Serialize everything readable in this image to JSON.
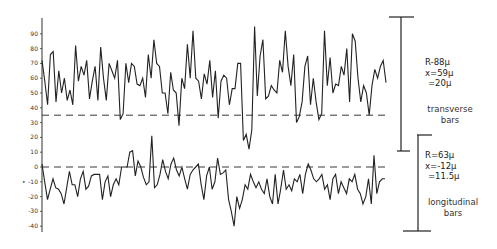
{
  "chart_data": {
    "type": "line",
    "title": "",
    "xlabel": "",
    "ylabel": "",
    "ylim": [
      -45,
      100
    ],
    "grid": false,
    "y_ticks": [
      90,
      80,
      70,
      60,
      50,
      40,
      30,
      20,
      10,
      0,
      -10,
      -20,
      -30,
      -40
    ],
    "y_tick_labels": [
      "90",
      "80",
      "70",
      "60",
      "50",
      "40",
      "30",
      "20",
      "10",
      "0",
      "-10",
      "-20",
      "-30",
      "-40"
    ],
    "reference_lines": [
      {
        "name": "transverse mean",
        "y": 35,
        "style": "dashed"
      },
      {
        "name": "longitudinal mean",
        "y": 0,
        "style": "dashed"
      }
    ],
    "series": [
      {
        "name": "transverse bars",
        "values": [
          72,
          58,
          42,
          76,
          78,
          44,
          65,
          50,
          60,
          45,
          52,
          42,
          82,
          58,
          68,
          62,
          72,
          46,
          58,
          68,
          45,
          81,
          60,
          45,
          70,
          65,
          60,
          72,
          32,
          36,
          70,
          57,
          70,
          68,
          56,
          55,
          60,
          47,
          76,
          60,
          86,
          70,
          68,
          50,
          50,
          36,
          64,
          52,
          50,
          28,
          60,
          53,
          83,
          60,
          92,
          60,
          58,
          46,
          63,
          56,
          72,
          47,
          65,
          33,
          58,
          62,
          60,
          42,
          53,
          53,
          70,
          70,
          18,
          22,
          12,
          25,
          95,
          48,
          75,
          86,
          46,
          48,
          55,
          52,
          50,
          72,
          64,
          92,
          68,
          55,
          76,
          30,
          34,
          44,
          68,
          75,
          42,
          60,
          44,
          32,
          36,
          92,
          55,
          74,
          50,
          56,
          55,
          68,
          62,
          80,
          44,
          90,
          85,
          60,
          44,
          55,
          50,
          35,
          55,
          66,
          60,
          68,
          72,
          57
        ],
        "x_start_px": 42,
        "x_end_px": 386
      },
      {
        "name": "longitudinal bars",
        "values": [
          2,
          -10,
          -22,
          -15,
          -8,
          -14,
          -15,
          -18,
          -25,
          -14,
          -3,
          -12,
          -12,
          -20,
          -8,
          -3,
          -15,
          -13,
          -6,
          -5,
          -5,
          -5,
          -22,
          -10,
          -6,
          -20,
          -12,
          -8,
          -12,
          0,
          0,
          0,
          10,
          11,
          -6,
          4,
          0,
          -7,
          -12,
          -10,
          21,
          -14,
          -12,
          -5,
          5,
          -3,
          -8,
          2,
          6,
          -2,
          -6,
          0,
          -8,
          -15,
          -5,
          -2,
          0,
          2,
          -12,
          -22,
          -6,
          0,
          -15,
          -10,
          6,
          -5,
          -4,
          -2,
          -22,
          -30,
          -40,
          -20,
          -28,
          -22,
          -12,
          -15,
          -5,
          -10,
          -14,
          -10,
          -15,
          -18,
          -8,
          -20,
          -25,
          -5,
          -25,
          -15,
          -2,
          -15,
          -12,
          -16,
          -8,
          -10,
          -5,
          -18,
          -5,
          2,
          -2,
          -8,
          -10,
          -8,
          -5,
          -15,
          -12,
          -22,
          -8,
          -5,
          -18,
          -10,
          -14,
          -18,
          -8,
          -10,
          -5,
          -15,
          -18,
          -25,
          -20,
          -8,
          -25,
          8,
          -18,
          -10,
          -8,
          -8
        ],
        "x_start_px": 42,
        "x_end_px": 385
      }
    ],
    "annotations": [
      {
        "text": "R-88µ",
        "series": "transverse bars"
      },
      {
        "text": "x=59µ",
        "series": "transverse bars"
      },
      {
        "text": "=20µ",
        "series": "transverse bars"
      },
      {
        "text": "R=63µ",
        "series": "longitudinal bars"
      },
      {
        "text": "x=-12µ",
        "series": "longitudinal bars"
      },
      {
        "text": "=11.5µ",
        "series": "longitudinal bars"
      }
    ],
    "legend": "none (side labels)"
  },
  "transverse": {
    "range": "R-88µ",
    "mean": "x=59µ",
    "sd": "=20µ",
    "label_line1": "transverse",
    "label_line2": "bars"
  },
  "longitudinal": {
    "range": "R=63µ",
    "mean": "x=-12µ",
    "sd": "=11.5µ",
    "label_line1": "longitudinal",
    "label_line2": "bars"
  },
  "colors": {
    "line": "#222222",
    "axis": "#333333",
    "background": "#ffffff"
  }
}
